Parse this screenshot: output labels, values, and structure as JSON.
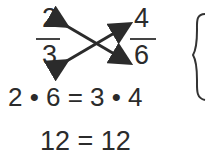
{
  "fraction_left": {
    "numerator": "2",
    "denominator": "3"
  },
  "fraction_right": {
    "numerator": "4",
    "denominator": "6"
  },
  "cross_multiplication": "2 • 6 = 3 • 4",
  "result": "12 = 12",
  "icons": {
    "arrows": "cross-multiply-arrows",
    "brace": "right-curly-brace"
  }
}
